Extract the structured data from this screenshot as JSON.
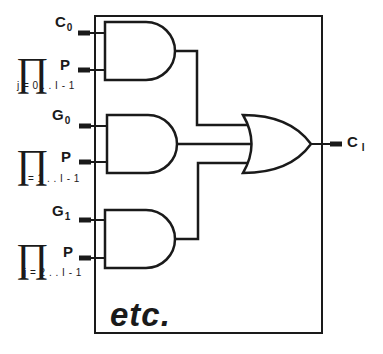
{
  "diagram": {
    "type": "carry-lookahead logic block",
    "box": {
      "stroke": "#1a1a1a"
    },
    "inputs": [
      {
        "signal": "C",
        "signal_sub": "0",
        "product_label": "P",
        "product_range": "j = 0 . . I - 1"
      },
      {
        "signal": "G",
        "signal_sub": "0",
        "product_label": "P",
        "product_range": "j = 1 . . I - 1"
      },
      {
        "signal": "G",
        "signal_sub": "1",
        "product_label": "P",
        "product_range": "j = 2 . . I - 1"
      }
    ],
    "product_symbol": "∏",
    "gates": [
      "AND",
      "AND",
      "AND",
      "OR"
    ],
    "output": {
      "signal": "C",
      "signal_sub": "I"
    },
    "continuation": "etc."
  }
}
